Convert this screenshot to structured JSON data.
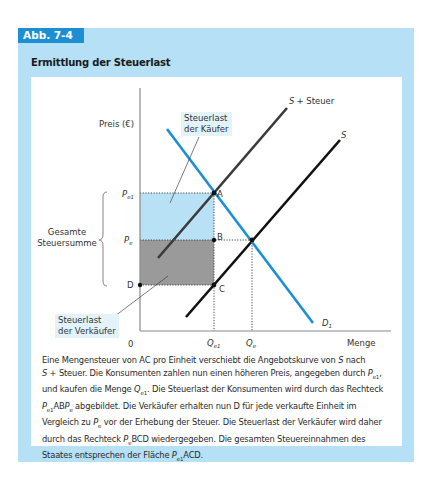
{
  "figure": {
    "label": "Abb. 7-4",
    "title": "Ermittlung der Steuerlast",
    "colors": {
      "frame": "#b5e0f5",
      "label_bg": "#1c8fd4",
      "demand": "#1c8fd4",
      "supply": "#111111",
      "supply_tax": "#3a3a3a",
      "buyer_burden_fill": "#b9e1f6",
      "seller_burden_fill": "#9a9a9a"
    }
  },
  "diagram": {
    "y_axis_label": "Preis (€)",
    "x_axis_label": "Menge",
    "origin_label": "0",
    "curves": {
      "supply": "S",
      "supply_tax": "S + Steuer",
      "demand": "D",
      "demand_sub": "1"
    },
    "price_levels": [
      {
        "symbol": "P",
        "sub": "e1"
      },
      {
        "symbol": "P",
        "sub": "e"
      }
    ],
    "quantity_levels": [
      {
        "symbol": "Q",
        "sub": "e1"
      },
      {
        "symbol": "Q",
        "sub": "e"
      }
    ],
    "points": [
      "A",
      "B",
      "C",
      "D"
    ],
    "brace_label_line1": "Gesamte",
    "brace_label_line2": "Steuersumme",
    "callout_buyers_line1": "Steuerlast",
    "callout_buyers_line2": "der Käufer",
    "callout_sellers_line1": "Steuerlast",
    "callout_sellers_line2": "der Verkäufer"
  },
  "caption": {
    "lines": [
      "Eine Mengensteuer von AC pro Einheit verschiebt die Angebotskurve von S nach",
      "S + Steuer. Die Konsumenten zahlen nun einen höheren Preis, angegeben durch Pe1,",
      "und kaufen die Menge Qe1. Die Steuerlast der Konsumenten wird durch das Rechteck",
      "Pe1ABPe abgebildet. Die Verkäufer erhalten nun D für jede verkaufte Einheit im",
      "Vergleich zu Pe vor der Erhebung der Steuer. Die Steuerlast der Verkäufer wird daher",
      "durch das Rechteck PeBCD wiedergegeben. Die gesamten Steuereinnahmen des",
      "Staates entsprechen der Fläche Pe1ACD."
    ],
    "seg": {
      "l1a": "Eine Mengensteuer von AC pro Einheit verschiebt die Angebotskurve von ",
      "l1b": "S",
      "l1c": " nach",
      "l2a": "S",
      "l2b": " + Steuer. Die Konsumenten zahlen nun einen höheren Preis, angegeben durch ",
      "l2c": "P",
      "l2d": "e1",
      "l2e": ",",
      "l3a": "und kaufen die Menge ",
      "l3b": "Q",
      "l3c": "e1",
      "l3d": ". Die Steuerlast der Konsumenten wird durch das Rechteck",
      "l4a": "P",
      "l4b": "e1",
      "l4c": "AB",
      "l4d": "P",
      "l4e": "e",
      "l4f": " abgebildet. Die Verkäufer erhalten nun D für jede verkaufte Einheit im",
      "l5a": "Vergleich zu ",
      "l5b": "P",
      "l5c": "e",
      "l5d": " vor der Erhebung der Steuer. Die Steuerlast der Verkäufer wird daher",
      "l6a": "durch das Rechteck ",
      "l6b": "P",
      "l6c": "e",
      "l6d": "BCD wiedergegeben. Die gesamten Steuereinnahmen des",
      "l7a": "Staates entsprechen der Fläche ",
      "l7b": "P",
      "l7c": "e1",
      "l7d": "ACD."
    }
  }
}
